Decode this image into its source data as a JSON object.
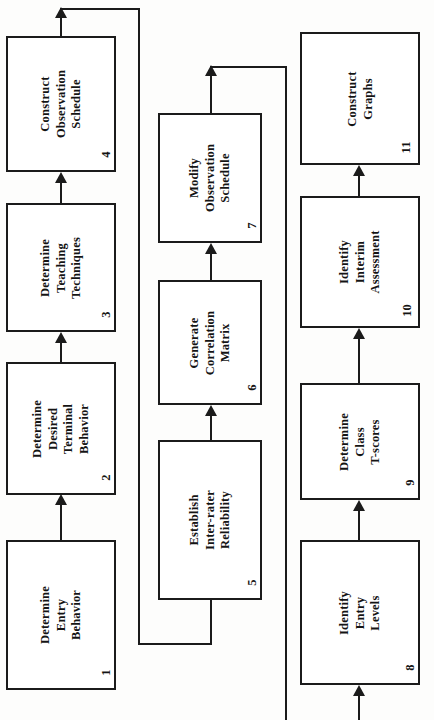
{
  "diagram": {
    "orientation": "rotated-90",
    "nodes": [
      {
        "id": "n1",
        "number": "1",
        "lines": [
          "Determine",
          "Entry",
          "Behavior"
        ]
      },
      {
        "id": "n2",
        "number": "2",
        "lines": [
          "Determine",
          "Desired",
          "Terminal",
          "Behavior"
        ]
      },
      {
        "id": "n3",
        "number": "3",
        "lines": [
          "Determine",
          "Teaching",
          "Techniques"
        ]
      },
      {
        "id": "n4",
        "number": "4",
        "lines": [
          "Construct",
          "Observation",
          "Schedule"
        ]
      },
      {
        "id": "n5",
        "number": "5",
        "lines": [
          "Establish",
          "Inter-rater",
          "Reliability"
        ]
      },
      {
        "id": "n6",
        "number": "6",
        "lines": [
          "Generate",
          "Correlation",
          "Matrix"
        ]
      },
      {
        "id": "n7",
        "number": "7",
        "lines": [
          "Modify",
          "Observation",
          "Schedule"
        ]
      },
      {
        "id": "n8",
        "number": "8",
        "lines": [
          "Identify",
          "Entry",
          "Levels"
        ]
      },
      {
        "id": "n9",
        "number": "9",
        "lines": [
          "Determine",
          "Class",
          "T-scores"
        ]
      },
      {
        "id": "n10",
        "number": "10",
        "lines": [
          "Identify",
          "Interim",
          "Assessment"
        ]
      },
      {
        "id": "n11",
        "number": "11",
        "lines": [
          "Construct",
          "Graphs"
        ]
      }
    ],
    "edges": [
      {
        "from": "n1",
        "to": "n2",
        "kind": "arrow"
      },
      {
        "from": "n2",
        "to": "n3",
        "kind": "arrow"
      },
      {
        "from": "n3",
        "to": "n4",
        "kind": "arrow"
      },
      {
        "from": "n4",
        "to": "n5",
        "kind": "routed-line"
      },
      {
        "from": "n5",
        "to": "n6",
        "kind": "arrow"
      },
      {
        "from": "n6",
        "to": "n7",
        "kind": "arrow"
      },
      {
        "from": "n7",
        "to": "n8",
        "kind": "routed-line"
      },
      {
        "from": "n8",
        "to": "n9",
        "kind": "arrow"
      },
      {
        "from": "n9",
        "to": "n10",
        "kind": "arrow"
      },
      {
        "from": "n10",
        "to": "n11",
        "kind": "arrow"
      }
    ]
  }
}
